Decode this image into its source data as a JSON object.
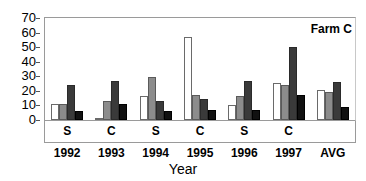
{
  "chart_data": {
    "type": "bar",
    "title": "",
    "annotation": "Farm C",
    "xlabel": "Year",
    "ylabel": "",
    "ylim": [
      0,
      70
    ],
    "ytick_step": 10,
    "yticks": [
      0,
      10,
      20,
      30,
      40,
      50,
      60,
      70
    ],
    "ytick_labels": [
      "0",
      "10",
      "20",
      "30",
      "40",
      "50",
      "60",
      "70"
    ],
    "grid": false,
    "legend": "none",
    "categories": [
      "1992",
      "1993",
      "1994",
      "1995",
      "1996",
      "1997",
      "AVG"
    ],
    "sublabels": [
      "S",
      "C",
      "S",
      "C",
      "S",
      "C",
      ""
    ],
    "series": [
      {
        "name": "series-1",
        "color": "#ffffff",
        "values": [
          11.3,
          1.0,
          16.5,
          57.2,
          10.0,
          25.2,
          20.5
        ]
      },
      {
        "name": "series-2",
        "color": "#8c8c8c",
        "values": [
          10.8,
          13.0,
          29.5,
          17.5,
          16.2,
          24.0,
          19.0
        ]
      },
      {
        "name": "series-3",
        "color": "#3a3a3a",
        "values": [
          24.0,
          27.0,
          13.0,
          14.2,
          27.0,
          50.2,
          26.0
        ]
      },
      {
        "name": "series-4",
        "color": "#111111",
        "values": [
          6.5,
          11.0,
          6.0,
          6.8,
          7.0,
          17.2,
          9.2
        ]
      }
    ]
  }
}
